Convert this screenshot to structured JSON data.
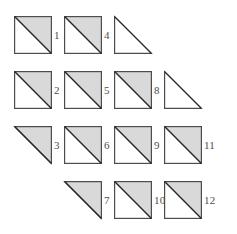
{
  "figure": {
    "colors": {
      "shade_fill": "#d9d9d9",
      "outline": "#4d4d4d",
      "diagonal": "#262626",
      "label_text": "#4d4d4d",
      "background": "#ffffff"
    },
    "geometry": {
      "cell_width": 50,
      "cell_height": 55,
      "shape_size": 38,
      "columns": 4,
      "rows": 4
    },
    "cells": [
      {
        "id": "r1c1",
        "row": 1,
        "column": 1,
        "x": 14,
        "y": 10,
        "kind": "square-upper-right-shaded",
        "shaded": true,
        "label": "1",
        "has_label": true
      },
      {
        "id": "r1c2",
        "row": 1,
        "column": 2,
        "x": 64,
        "y": 10,
        "kind": "square-upper-right-shaded",
        "shaded": true,
        "label": "4",
        "has_label": true
      },
      {
        "id": "r1c3",
        "row": 1,
        "column": 3,
        "x": 114,
        "y": 10,
        "kind": "triangle-lower-left-open",
        "shaded": false,
        "label": "",
        "has_label": false
      },
      {
        "id": "r1c4",
        "row": 1,
        "column": 4,
        "x": 164,
        "y": 10,
        "kind": "empty",
        "shaded": false,
        "label": "",
        "has_label": false
      },
      {
        "id": "r2c1",
        "row": 2,
        "column": 1,
        "x": 14,
        "y": 65,
        "kind": "square-upper-right-shaded",
        "shaded": true,
        "label": "2",
        "has_label": true
      },
      {
        "id": "r2c2",
        "row": 2,
        "column": 2,
        "x": 64,
        "y": 65,
        "kind": "square-upper-right-shaded",
        "shaded": true,
        "label": "5",
        "has_label": true
      },
      {
        "id": "r2c3",
        "row": 2,
        "column": 3,
        "x": 114,
        "y": 65,
        "kind": "square-upper-right-shaded",
        "shaded": true,
        "label": "8",
        "has_label": true
      },
      {
        "id": "r2c4",
        "row": 2,
        "column": 4,
        "x": 164,
        "y": 65,
        "kind": "triangle-lower-left-open",
        "shaded": false,
        "label": "",
        "has_label": false
      },
      {
        "id": "r3c1",
        "row": 3,
        "column": 1,
        "x": 14,
        "y": 120,
        "kind": "triangle-upper-right-filled",
        "shaded": true,
        "label": "3",
        "has_label": true
      },
      {
        "id": "r3c2",
        "row": 3,
        "column": 2,
        "x": 64,
        "y": 120,
        "kind": "square-upper-right-shaded",
        "shaded": true,
        "label": "6",
        "has_label": true
      },
      {
        "id": "r3c3",
        "row": 3,
        "column": 3,
        "x": 114,
        "y": 120,
        "kind": "square-upper-right-shaded",
        "shaded": true,
        "label": "9",
        "has_label": true
      },
      {
        "id": "r3c4",
        "row": 3,
        "column": 4,
        "x": 164,
        "y": 120,
        "kind": "square-upper-right-shaded",
        "shaded": true,
        "label": "11",
        "has_label": true
      },
      {
        "id": "r4c1",
        "row": 4,
        "column": 1,
        "x": 14,
        "y": 175,
        "kind": "empty",
        "shaded": false,
        "label": "",
        "has_label": false
      },
      {
        "id": "r4c2",
        "row": 4,
        "column": 2,
        "x": 64,
        "y": 175,
        "kind": "triangle-upper-right-filled",
        "shaded": true,
        "label": "7",
        "has_label": true
      },
      {
        "id": "r4c3",
        "row": 4,
        "column": 3,
        "x": 114,
        "y": 175,
        "kind": "square-upper-right-shaded",
        "shaded": true,
        "label": "10",
        "has_label": true
      },
      {
        "id": "r4c4",
        "row": 4,
        "column": 4,
        "x": 164,
        "y": 175,
        "kind": "square-upper-right-shaded",
        "shaded": true,
        "label": "12",
        "has_label": true
      }
    ]
  }
}
